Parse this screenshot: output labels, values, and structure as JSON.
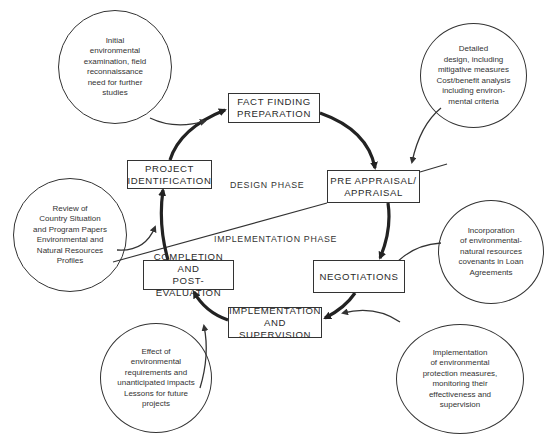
{
  "diagram": {
    "type": "project-cycle",
    "phases": {
      "design": "DESIGN PHASE",
      "implementation": "IMPLEMENTATION PHASE"
    },
    "stages": [
      {
        "id": "fact-finding",
        "lines": [
          "FACT FINDING",
          "PREPARATION"
        ]
      },
      {
        "id": "pre-appraisal",
        "lines": [
          "PRE APPRAISAL/",
          "APPRAISAL"
        ]
      },
      {
        "id": "negotiations",
        "lines": [
          "NEGOTIATIONS"
        ]
      },
      {
        "id": "implementation",
        "lines": [
          "IMPLEMENTATION",
          "AND SUPERVISION"
        ]
      },
      {
        "id": "completion",
        "lines": [
          "COMPLETION AND",
          "POST-EVALUATION"
        ]
      },
      {
        "id": "identification",
        "lines": [
          "PROJECT",
          "IDENTIFICATION"
        ]
      }
    ],
    "notes": [
      {
        "id": "fact-finding-note",
        "target": "fact-finding",
        "lines": [
          "Initial",
          "environmental",
          "examination, field",
          "reconnaissance",
          "need for further",
          "studies"
        ]
      },
      {
        "id": "pre-appraisal-note",
        "target": "pre-appraisal",
        "lines": [
          "Detailed",
          "design, including",
          "mitigative measures",
          "Cost/benefit analysis",
          "including environ-",
          "mental criteria"
        ]
      },
      {
        "id": "identification-note",
        "target": "identification",
        "lines": [
          "Review of",
          "Country Situation",
          "and Program Papers",
          "Environmental and",
          "Natural Resources",
          "Profiles"
        ]
      },
      {
        "id": "negotiations-note",
        "target": "negotiations",
        "lines": [
          "Incorporation",
          "of environmental-",
          "natural resources",
          "covenants in Loan",
          "Agreements"
        ]
      },
      {
        "id": "completion-note",
        "target": "completion",
        "lines": [
          "Effect of",
          "environmental",
          "requirements and",
          "unanticipated impacts",
          "Lessons for future",
          "projects"
        ]
      },
      {
        "id": "implementation-note",
        "target": "implementation",
        "lines": [
          "Implementation",
          "of environmental",
          "protection measures,",
          "monitoring their",
          "effectiveness and",
          "supervision"
        ]
      }
    ],
    "colors": {
      "ink": "#2a2a2a",
      "background": "#ffffff"
    }
  }
}
